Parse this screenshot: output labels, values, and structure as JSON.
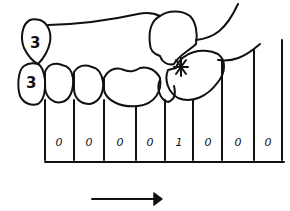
{
  "diagram": {
    "type": "dental-occlusion-sketch",
    "upper_tooth_label": "3",
    "lower_tooth_label": "3",
    "contact_marker": "*",
    "grid": {
      "cells": [
        "0",
        "0",
        "0",
        "0",
        "1",
        "0",
        "0",
        "0"
      ]
    },
    "arrow": {
      "direction": "right"
    },
    "colors": {
      "ink": "#111111",
      "background": "#ffffff"
    }
  }
}
